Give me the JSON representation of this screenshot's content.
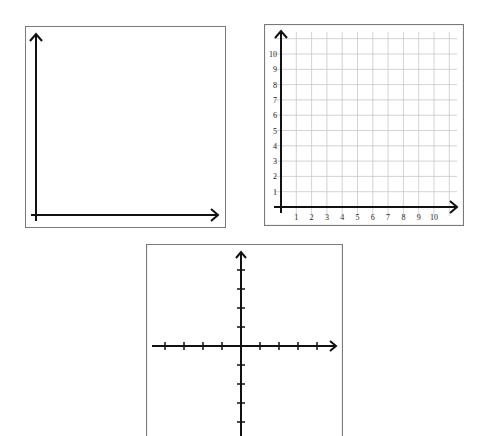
{
  "figures": [
    {
      "id": "blank-first-quadrant",
      "description": "Blank first-quadrant axes with arrows, no grid or labels",
      "border_color": "#7a7a7a",
      "axis_color": "#111111"
    },
    {
      "id": "gridded-first-quadrant",
      "description": "First-quadrant coordinate grid 0-10 with labeled ticks",
      "border_color": "#7a7a7a",
      "grid_color": "#c8c8c8",
      "axis_color": "#111111",
      "x_tick_labels": [
        "1",
        "2",
        "3",
        "4",
        "5",
        "6",
        "7",
        "8",
        "9",
        "10"
      ],
      "y_tick_labels": [
        "1",
        "2",
        "3",
        "4",
        "5",
        "6",
        "7",
        "8",
        "9",
        "10"
      ]
    },
    {
      "id": "four-quadrant-axes",
      "description": "Cartesian plane axes with tick marks, four on each side of origin, no labels",
      "border_color": "#7a7a7a",
      "axis_color": "#111111",
      "ticks_per_side": 4
    }
  ],
  "chart_data": [
    {
      "type": "blank_axes",
      "title": "",
      "xlabel": "",
      "ylabel": "",
      "quadrants": "I",
      "grid": false,
      "ticks": false
    },
    {
      "type": "grid",
      "title": "",
      "xlabel": "",
      "ylabel": "",
      "quadrants": "I",
      "grid": true,
      "xlim": [
        0,
        11
      ],
      "ylim": [
        0,
        11
      ],
      "x_ticks": [
        1,
        2,
        3,
        4,
        5,
        6,
        7,
        8,
        9,
        10
      ],
      "y_ticks": [
        1,
        2,
        3,
        4,
        5,
        6,
        7,
        8,
        9,
        10
      ]
    },
    {
      "type": "blank_axes",
      "title": "",
      "xlabel": "",
      "ylabel": "",
      "quadrants": "I-IV",
      "grid": false,
      "ticks": true,
      "x_ticks": [
        -4,
        -3,
        -2,
        -1,
        1,
        2,
        3,
        4
      ],
      "y_ticks": [
        -4,
        -3,
        -2,
        -1,
        1,
        2,
        3,
        4
      ]
    }
  ]
}
